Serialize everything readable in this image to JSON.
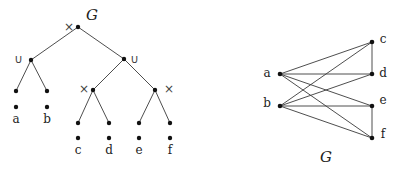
{
  "left_diagram": {
    "title": "G",
    "description": "Cotree / parse tree of graph G",
    "nodes": [
      {
        "id": "root",
        "op": "×",
        "x": 78,
        "y": 27
      },
      {
        "id": "u1",
        "op": "∪",
        "x": 31,
        "y": 60
      },
      {
        "id": "u2",
        "op": "∪",
        "x": 124,
        "y": 59
      },
      {
        "id": "x1",
        "op": "×",
        "x": 93,
        "y": 90
      },
      {
        "id": "x2",
        "op": "×",
        "x": 155,
        "y": 90
      },
      {
        "id": "la",
        "x": 16,
        "y": 91
      },
      {
        "id": "lb",
        "x": 47,
        "y": 91
      },
      {
        "id": "lc",
        "x": 78,
        "y": 123
      },
      {
        "id": "ld",
        "x": 109,
        "y": 123
      },
      {
        "id": "le",
        "x": 139,
        "y": 123
      },
      {
        "id": "lf",
        "x": 170,
        "y": 123
      }
    ],
    "edges": [
      [
        "root",
        "u1"
      ],
      [
        "root",
        "u2"
      ],
      [
        "u1",
        "la"
      ],
      [
        "u1",
        "lb"
      ],
      [
        "u2",
        "x1"
      ],
      [
        "u2",
        "x2"
      ],
      [
        "x1",
        "lc"
      ],
      [
        "x1",
        "ld"
      ],
      [
        "x2",
        "le"
      ],
      [
        "x2",
        "lf"
      ]
    ],
    "vertices": [
      {
        "label": "a",
        "x": 16,
        "y": 107
      },
      {
        "label": "b",
        "x": 47,
        "y": 107
      },
      {
        "label": "c",
        "x": 78,
        "y": 138
      },
      {
        "label": "d",
        "x": 109,
        "y": 138
      },
      {
        "label": "e",
        "x": 139,
        "y": 138
      },
      {
        "label": "f",
        "x": 170,
        "y": 138
      }
    ]
  },
  "right_diagram": {
    "title": "G",
    "description": "Graph G",
    "vertices": [
      {
        "label": "a",
        "x": 280,
        "y": 74
      },
      {
        "label": "b",
        "x": 280,
        "y": 106
      },
      {
        "label": "c",
        "x": 372,
        "y": 42
      },
      {
        "label": "d",
        "x": 372,
        "y": 74
      },
      {
        "label": "e",
        "x": 372,
        "y": 106
      },
      {
        "label": "f",
        "x": 372,
        "y": 138
      }
    ],
    "edges": [
      [
        "a",
        "c"
      ],
      [
        "a",
        "d"
      ],
      [
        "a",
        "e"
      ],
      [
        "a",
        "f"
      ],
      [
        "b",
        "c"
      ],
      [
        "b",
        "d"
      ],
      [
        "b",
        "e"
      ],
      [
        "b",
        "f"
      ],
      [
        "c",
        "d"
      ],
      [
        "e",
        "f"
      ]
    ]
  }
}
